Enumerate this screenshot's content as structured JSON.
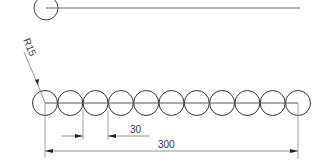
{
  "drawing": {
    "top_view": {
      "circle": {
        "cx": 46,
        "cy": 8,
        "r": 12
      },
      "line": {
        "x1": 46,
        "x2": 300,
        "y": 8
      }
    },
    "radius_label": "R15",
    "pitch_label": "30",
    "overall_label": "300",
    "circle_count": 11,
    "row": {
      "first_cx": 45,
      "spacing": 25.3,
      "cy": 103,
      "r": 12.5
    },
    "colors": {
      "line": "#333333",
      "thin": "#777777"
    }
  }
}
